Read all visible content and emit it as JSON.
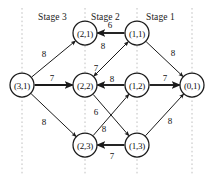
{
  "figure": {
    "type": "diagram",
    "subtype": "directed-network-stage-graph",
    "background_color": "#ffffff",
    "stroke_color": "#1a1a1a",
    "dashed_color": "#b9b9b9",
    "width": 219,
    "height": 180
  },
  "stages": [
    {
      "id": "stage-3",
      "label": "Stage 3",
      "x": 38,
      "y": 12
    },
    {
      "id": "stage-2",
      "label": "Stage 2",
      "x": 91,
      "y": 12
    },
    {
      "id": "stage-1",
      "label": "Stage 1",
      "x": 146,
      "y": 12
    }
  ],
  "dashed_lines": [
    {
      "x": 22,
      "y1": 8,
      "y2": 174
    },
    {
      "x": 85,
      "y1": 8,
      "y2": 174
    },
    {
      "x": 137,
      "y1": 8,
      "y2": 174
    },
    {
      "x": 192,
      "y1": 8,
      "y2": 174
    }
  ],
  "nodes": [
    {
      "id": "n-3-1",
      "label": "(3,1)",
      "cx": 22,
      "cy": 85,
      "r": 12
    },
    {
      "id": "n-2-1",
      "label": "(2,1)",
      "cx": 85,
      "cy": 33,
      "r": 12
    },
    {
      "id": "n-2-2",
      "label": "(2,2)",
      "cx": 85,
      "cy": 85,
      "r": 12
    },
    {
      "id": "n-2-3",
      "label": "(2,3)",
      "cx": 85,
      "cy": 145,
      "r": 12
    },
    {
      "id": "n-1-1",
      "label": "(1,1)",
      "cx": 137,
      "cy": 33,
      "r": 12
    },
    {
      "id": "n-1-2",
      "label": "(1,2)",
      "cx": 137,
      "cy": 85,
      "r": 12
    },
    {
      "id": "n-1-3",
      "label": "(1,3)",
      "cx": 137,
      "cy": 145,
      "r": 12
    },
    {
      "id": "n-0-1",
      "label": "(0,1)",
      "cx": 192,
      "cy": 85,
      "r": 12
    }
  ],
  "edges": [
    {
      "id": "e-31-21",
      "from": "n-3-1",
      "to": "n-2-1",
      "weight": "8",
      "label_x": 44,
      "label_y": 54,
      "thick": false
    },
    {
      "id": "e-31-22",
      "from": "n-3-1",
      "to": "n-2-2",
      "weight": "7",
      "label_x": 52,
      "label_y": 78,
      "thick": true
    },
    {
      "id": "e-31-23",
      "from": "n-3-1",
      "to": "n-2-3",
      "weight": "8",
      "label_x": 44,
      "label_y": 122,
      "thick": false
    },
    {
      "id": "e-11-21",
      "from": "n-1-1",
      "to": "n-2-1",
      "weight": "6",
      "label_x": 110,
      "label_y": 25,
      "thick": true
    },
    {
      "id": "e-11-22",
      "from": "n-1-1",
      "to": "n-2-2",
      "weight": "8",
      "label_x": 103,
      "label_y": 46,
      "thick": false
    },
    {
      "id": "e-22-11",
      "from": "n-2-2",
      "to": "n-1-1",
      "weight": "7",
      "label_x": 96,
      "label_y": 68,
      "thick": false
    },
    {
      "id": "e-12-22",
      "from": "n-1-2",
      "to": "n-2-2",
      "weight": "8",
      "label_x": 112,
      "label_y": 79,
      "thick": true
    },
    {
      "id": "e-22-13",
      "from": "n-2-2",
      "to": "n-1-3",
      "weight": "6",
      "label_x": 96,
      "label_y": 112,
      "thick": false
    },
    {
      "id": "e-23-12",
      "from": "n-2-3",
      "to": "n-1-2",
      "weight": "8",
      "label_x": 104,
      "label_y": 129,
      "thick": false
    },
    {
      "id": "e-13-23",
      "from": "n-1-3",
      "to": "n-2-3",
      "weight": "7",
      "label_x": 112,
      "label_y": 156,
      "thick": true
    },
    {
      "id": "e-11-01",
      "from": "n-1-1",
      "to": "n-0-1",
      "weight": "8",
      "label_x": 173,
      "label_y": 53,
      "thick": false
    },
    {
      "id": "e-12-01",
      "from": "n-1-2",
      "to": "n-0-1",
      "weight": "7",
      "label_x": 165,
      "label_y": 78,
      "thick": true
    },
    {
      "id": "e-13-01",
      "from": "n-1-3",
      "to": "n-0-1",
      "weight": "8",
      "label_x": 170,
      "label_y": 121,
      "thick": false
    }
  ]
}
